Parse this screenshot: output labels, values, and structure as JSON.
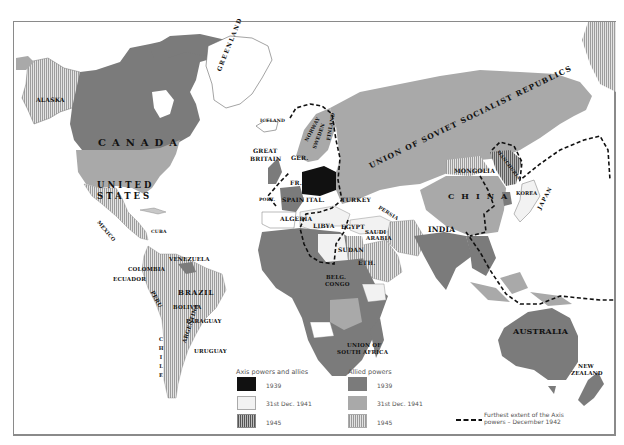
{
  "colors": {
    "axis_1939": "#111111",
    "axis_1941": "#f2f2f2",
    "allied_1939": "#7b7b7b",
    "allied_1941": "#a9a9a9",
    "allied_1945_hatch": "#c8c8c8",
    "axis_1945_hatch": "#6a6a6a",
    "water": "#ffffff",
    "frame": "#8a8a8a"
  },
  "labels": {
    "alaska": "ALASKA",
    "canada": "CANADA",
    "united_states_line1": "UNITED",
    "united_states_line2": "STATES",
    "greenland": "GREENLAND",
    "iceland": "ICELAND",
    "great_britain_line1": "GREAT",
    "great_britain_line2": "BRITAIN",
    "germany": "GER.",
    "norway": "NORWAY",
    "sweden": "SWEDEN",
    "finland": "FINLAND",
    "france": "FR.",
    "portugal": "PORT.",
    "spain": "SPAIN",
    "italy": "ITAL.",
    "turkey": "TURKEY",
    "persia": "PERSIA",
    "algeria": "ALGERIA",
    "libya": "LIBYA",
    "egypt": "EGYPT",
    "saudi_arabia_line1": "SAUDI",
    "saudi_arabia_line2": "ARABIA",
    "sudan": "SUDAN",
    "ethiopia": "ETH.",
    "belgian_congo_line1": "BELG.",
    "belgian_congo_line2": "CONGO",
    "union_south_africa_line1": "UNION OF",
    "union_south_africa_line2": "SOUTH AFRICA",
    "ussr": "UNION OF SOVIET SOCIALIST REPUBLICS",
    "mongolia": "MONGOLIA",
    "china": "CHINA",
    "manchuria": "MANCHURIA",
    "korea": "KOREA",
    "japan": "JAPAN",
    "india": "INDIA",
    "australia": "AUSTRALIA",
    "new_zealand_line1": "NEW",
    "new_zealand_line2": "ZEALAND",
    "mexico": "MEXICO",
    "cuba": "CUBA",
    "venezuela": "VENEZUELA",
    "colombia": "COLOMBIA",
    "ecuador": "ECUADOR",
    "peru": "PERU",
    "brazil": "BRAZIL",
    "bolivia": "BOLIVIA",
    "paraguay": "PARAGUAY",
    "chile": "CHILE",
    "argentina": "ARGENTINA",
    "uruguay": "URUGUAY"
  },
  "legend": {
    "axis_heading": "Axis powers and allies",
    "allied_heading": "Allied powers",
    "axis_items": [
      {
        "label": "1939",
        "style": "solid-black"
      },
      {
        "label": "31st Dec. 1941",
        "style": "solid-white"
      },
      {
        "label": "1945",
        "style": "hatched-dark"
      }
    ],
    "allied_items": [
      {
        "label": "1939",
        "style": "solid-dark-gray"
      },
      {
        "label": "31st Dec. 1941",
        "style": "solid-mid-gray"
      },
      {
        "label": "1945",
        "style": "hatched-light"
      }
    ],
    "extent_line_1": "Furthest extent of the Axis",
    "extent_line_2": "powers – December 1942",
    "extent_symbol": "dashed-line"
  }
}
